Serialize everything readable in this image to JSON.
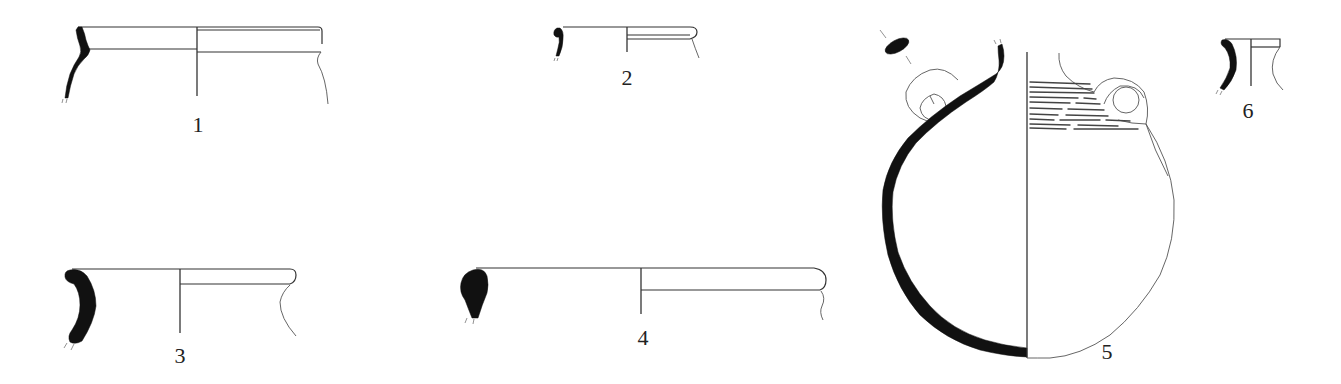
{
  "plate": {
    "background": "#ffffff",
    "ink_color": "#111111",
    "figures": [
      {
        "id": 1,
        "label": "1",
        "type": "rim-sherd",
        "description": "everted rim jar with carinated neck"
      },
      {
        "id": 2,
        "label": "2",
        "type": "rim-sherd",
        "description": "small hooked rim"
      },
      {
        "id": 3,
        "label": "3",
        "type": "rim-sherd",
        "description": "thick curved everted rim"
      },
      {
        "id": 4,
        "label": "4",
        "type": "rim-sherd",
        "description": "wide bowl with thickened rim"
      },
      {
        "id": 5,
        "label": "5",
        "type": "complete-vessel",
        "description": "globular two-handled jar with incised horizontal decoration on shoulder, handle section shown"
      },
      {
        "id": 6,
        "label": "6",
        "type": "rim-sherd",
        "description": "small flaring neck"
      }
    ]
  }
}
